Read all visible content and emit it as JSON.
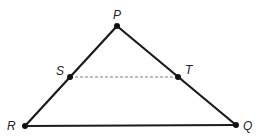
{
  "diagram": {
    "type": "triangle-with-midsegment",
    "points": {
      "P": {
        "label": "P",
        "x": 117,
        "y": 26
      },
      "S": {
        "label": "S",
        "x": 70,
        "y": 77
      },
      "T": {
        "label": "T",
        "x": 178,
        "y": 77
      },
      "R": {
        "label": "R",
        "x": 25,
        "y": 126
      },
      "Q": {
        "label": "Q",
        "x": 236,
        "y": 125
      }
    },
    "segments": [
      {
        "from": "P",
        "to": "R",
        "style": "solid"
      },
      {
        "from": "P",
        "to": "Q",
        "style": "solid"
      },
      {
        "from": "R",
        "to": "Q",
        "style": "solid"
      },
      {
        "from": "S",
        "to": "T",
        "style": "dashed"
      }
    ],
    "colors": {
      "line": "#1a1a1a",
      "dashed": "#555555",
      "point": "#111111"
    }
  }
}
